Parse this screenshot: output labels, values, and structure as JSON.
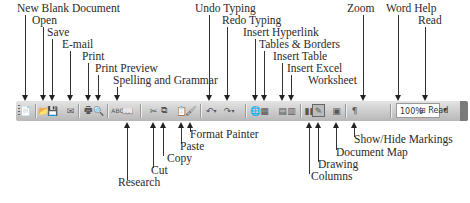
{
  "toolbar": {
    "zoom_value": "100%",
    "zoom_dropdown": "▾",
    "read_label": "Read",
    "buttons": [
      {
        "name": "new-blank-document",
        "glyph": "📄"
      },
      {
        "name": "open",
        "glyph": "📂"
      },
      {
        "name": "save",
        "glyph": "💾"
      },
      {
        "name": "e-mail",
        "glyph": "✉"
      },
      {
        "name": "print",
        "glyph": "🖶"
      },
      {
        "name": "print-preview",
        "glyph": "🔍"
      },
      {
        "name": "spelling-and-grammar",
        "glyph": "ABC"
      },
      {
        "name": "research",
        "glyph": "📖"
      },
      {
        "name": "cut",
        "glyph": "✂"
      },
      {
        "name": "copy",
        "glyph": "⧉"
      },
      {
        "name": "paste",
        "glyph": "📋"
      },
      {
        "name": "format-painter",
        "glyph": "🖌"
      },
      {
        "name": "undo-typing",
        "glyph": "↶"
      },
      {
        "name": "redo-typing",
        "glyph": "↷"
      },
      {
        "name": "insert-hyperlink",
        "glyph": "🌐"
      },
      {
        "name": "tables-and-borders",
        "glyph": "▦"
      },
      {
        "name": "insert-table",
        "glyph": "▤"
      },
      {
        "name": "insert-excel-worksheet",
        "glyph": "▥"
      },
      {
        "name": "columns",
        "glyph": "▮▮"
      },
      {
        "name": "drawing",
        "glyph": "✎"
      },
      {
        "name": "document-map",
        "glyph": "▣"
      },
      {
        "name": "show-hide-markings",
        "glyph": "¶"
      },
      {
        "name": "word-help",
        "glyph": "?"
      }
    ]
  },
  "callouts_top": [
    {
      "text": "New Blank Document",
      "label_x": 17,
      "label_y": 12,
      "target_x": 25
    },
    {
      "text": "Open",
      "label_x": 32,
      "label_y": 24,
      "target_x": 43
    },
    {
      "text": "Save",
      "label_x": 47,
      "label_y": 36,
      "target_x": 52
    },
    {
      "text": "E-mail",
      "label_x": 62,
      "label_y": 48,
      "target_x": 70
    },
    {
      "text": "Print",
      "label_x": 82,
      "label_y": 60,
      "target_x": 88
    },
    {
      "text": "Print Preview",
      "label_x": 95,
      "label_y": 72,
      "target_x": 98
    },
    {
      "text": "Spelling and Grammar",
      "label_x": 113,
      "label_y": 84,
      "target_x": 117
    },
    {
      "text": "Undo Typing",
      "label_x": 195,
      "label_y": 12,
      "target_x": 209
    },
    {
      "text": "Redo Typing",
      "label_x": 222,
      "label_y": 24,
      "target_x": 227
    },
    {
      "text": "Insert Hyperlink",
      "label_x": 243,
      "label_y": 36,
      "target_x": 255
    },
    {
      "text": "Tables & Borders",
      "label_x": 259,
      "label_y": 48,
      "target_x": 264
    },
    {
      "text": "Insert Table",
      "label_x": 273,
      "label_y": 60,
      "target_x": 282
    },
    {
      "text": "Insert Excel",
      "label_x": 287,
      "label_y": 72,
      "target_x": 291
    },
    {
      "text": "Worksheet",
      "label_x": 308,
      "label_y": 84,
      "target_x": null
    },
    {
      "text": "Zoom",
      "label_x": 347,
      "label_y": 12,
      "target_x": 363
    },
    {
      "text": "Word Help",
      "label_x": 386,
      "label_y": 12,
      "target_x": 398
    },
    {
      "text": "Read",
      "label_x": 418,
      "label_y": 24,
      "target_x": 425
    }
  ],
  "callouts_bottom": [
    {
      "text": "Research",
      "label_x": 118,
      "label_y": 186,
      "target_x": 127
    },
    {
      "text": "Cut",
      "label_x": 151,
      "label_y": 174,
      "target_x": 153
    },
    {
      "text": "Copy",
      "label_x": 167,
      "label_y": 162,
      "target_x": 163
    },
    {
      "text": "Paste",
      "label_x": 180,
      "label_y": 150,
      "target_x": 181
    },
    {
      "text": "Format Painter",
      "label_x": 190,
      "label_y": 138,
      "target_x": 190
    },
    {
      "text": "Columns",
      "label_x": 311,
      "label_y": 180,
      "target_x": 309
    },
    {
      "text": "Drawing",
      "label_x": 318,
      "label_y": 168,
      "target_x": 318
    },
    {
      "text": "Document Map",
      "label_x": 336,
      "label_y": 156,
      "target_x": 336
    },
    {
      "text": "Show/Hide Markings",
      "label_x": 354,
      "label_y": 143,
      "target_x": 354
    }
  ]
}
